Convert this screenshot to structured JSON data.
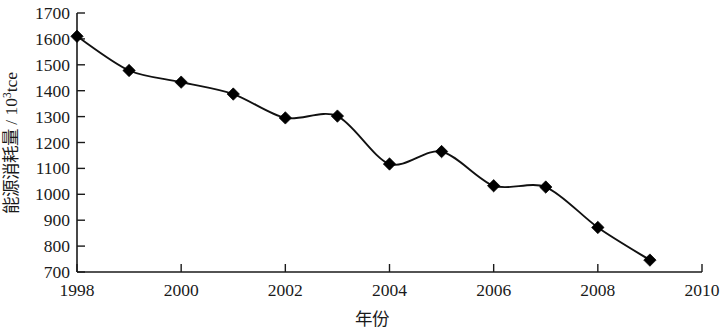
{
  "chart_data": {
    "type": "line",
    "title": "",
    "xlabel": "年份",
    "ylabel": "能源消耗量 / 10³tce",
    "ylabel_main": "能源消耗量 / 10",
    "ylabel_exp": "3",
    "ylabel_unit": "tce",
    "x": [
      1998,
      1999,
      2000,
      2001,
      2002,
      2003,
      2004,
      2005,
      2006,
      2007,
      2008,
      2009
    ],
    "values": [
      1610,
      1478,
      1433,
      1387,
      1295,
      1302,
      1117,
      1165,
      1033,
      1028,
      872,
      746
    ],
    "xlim": [
      1998,
      2010
    ],
    "ylim": [
      700,
      1700
    ],
    "x_ticks": [
      1998,
      2000,
      2002,
      2004,
      2006,
      2008,
      2010
    ],
    "x_tick_labels": [
      "1998",
      "2000",
      "2002",
      "2004",
      "2006",
      "2008",
      "2010"
    ],
    "y_ticks": [
      700,
      800,
      900,
      1000,
      1100,
      1200,
      1300,
      1400,
      1500,
      1600,
      1700
    ],
    "y_tick_labels": [
      "700",
      "800",
      "900",
      "1000",
      "1100",
      "1200",
      "1300",
      "1400",
      "1500",
      "1600",
      "1700"
    ],
    "grid": false,
    "legend": false,
    "marker": "diamond",
    "series_color": "#000000",
    "axis_color": "#1a1a1a",
    "background": "#ffffff"
  }
}
